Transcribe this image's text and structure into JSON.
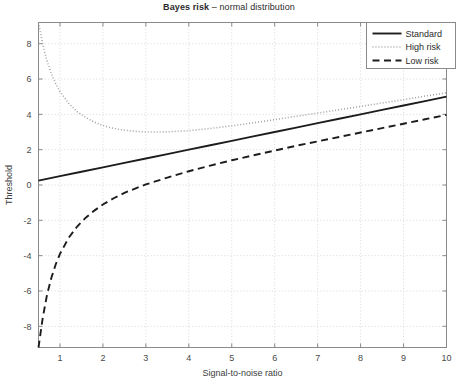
{
  "chart_data": {
    "type": "line",
    "title": "Bayes risk – normal distribution",
    "title_bold_part": "Bayes risk",
    "title_regular_part": "– normal distribution",
    "xlabel": "Signal-to-noise ratio",
    "ylabel": "Threshold",
    "xlim": [
      0.5,
      10
    ],
    "ylim": [
      -9.2,
      9.2
    ],
    "xticks": [
      1,
      2,
      3,
      4,
      5,
      6,
      7,
      8,
      9,
      10
    ],
    "xtick_labels": [
      "1",
      "2",
      "3",
      "4",
      "5",
      "6",
      "7",
      "8",
      "9",
      "10"
    ],
    "yticks": [
      -8,
      -6,
      -4,
      -2,
      0,
      2,
      4,
      6,
      8
    ],
    "ytick_labels": [
      "-8",
      "-6",
      "-4",
      "-2",
      "0",
      "2",
      "4",
      "6",
      "8"
    ],
    "grid": true,
    "grid_style": "dotted",
    "grid_color": "#cfcfcf",
    "axis_color": "#8a8a8a",
    "legend_position": "top-right",
    "series": [
      {
        "name": "Standard",
        "style": "solid",
        "color": "#1c1c1c",
        "x": [
          0.5,
          1,
          1.5,
          2,
          2.5,
          3,
          3.5,
          4,
          4.5,
          5,
          5.5,
          6,
          6.5,
          7,
          7.5,
          8,
          8.5,
          9,
          9.5,
          10
        ],
        "y": [
          0.25,
          0.5,
          0.75,
          1.0,
          1.25,
          1.5,
          1.75,
          2.0,
          2.25,
          2.5,
          2.75,
          3.0,
          3.25,
          3.5,
          3.75,
          4.0,
          4.25,
          4.5,
          4.75,
          5.0
        ]
      },
      {
        "name": "High risk",
        "style": "dotted",
        "color": "#9a9a9a",
        "x": [
          0.5,
          0.6,
          0.7,
          0.8,
          0.9,
          1.0,
          1.2,
          1.4,
          1.6,
          1.8,
          2.0,
          2.25,
          2.5,
          2.75,
          3.0,
          3.25,
          3.5,
          3.75,
          4.0,
          4.5,
          5.0,
          5.5,
          6.0,
          6.5,
          7.0,
          7.5,
          8.0,
          8.5,
          9.0,
          9.5,
          10.0
        ],
        "y": [
          9.2,
          7.95,
          7.0,
          6.3,
          5.75,
          5.3,
          4.63,
          4.15,
          3.82,
          3.56,
          3.37,
          3.2,
          3.1,
          3.04,
          3.0,
          3.0,
          3.01,
          3.04,
          3.08,
          3.2,
          3.35,
          3.52,
          3.7,
          3.89,
          4.07,
          4.26,
          4.45,
          4.64,
          4.83,
          5.03,
          5.22
        ]
      },
      {
        "name": "Low risk",
        "style": "dashed",
        "color": "#1c1c1c",
        "x": [
          0.5,
          0.55,
          0.6,
          0.7,
          0.8,
          0.9,
          1.0,
          1.2,
          1.4,
          1.6,
          1.8,
          2.0,
          2.25,
          2.5,
          2.75,
          3.0,
          3.5,
          4.0,
          4.5,
          5.0,
          5.5,
          6.0,
          6.5,
          7.0,
          7.5,
          8.0,
          8.5,
          9.0,
          9.5,
          10.0
        ],
        "y": [
          -9.2,
          -8.35,
          -7.5,
          -6.2,
          -5.25,
          -4.5,
          -3.9,
          -3.0,
          -2.35,
          -1.85,
          -1.45,
          -1.1,
          -0.75,
          -0.45,
          -0.2,
          0.03,
          0.42,
          0.78,
          1.1,
          1.4,
          1.68,
          1.95,
          2.22,
          2.47,
          2.72,
          2.97,
          3.22,
          3.47,
          3.72,
          3.97
        ]
      }
    ]
  },
  "legend": {
    "entries": [
      {
        "label": "Standard"
      },
      {
        "label": "High risk"
      },
      {
        "label": "Low risk"
      }
    ]
  }
}
